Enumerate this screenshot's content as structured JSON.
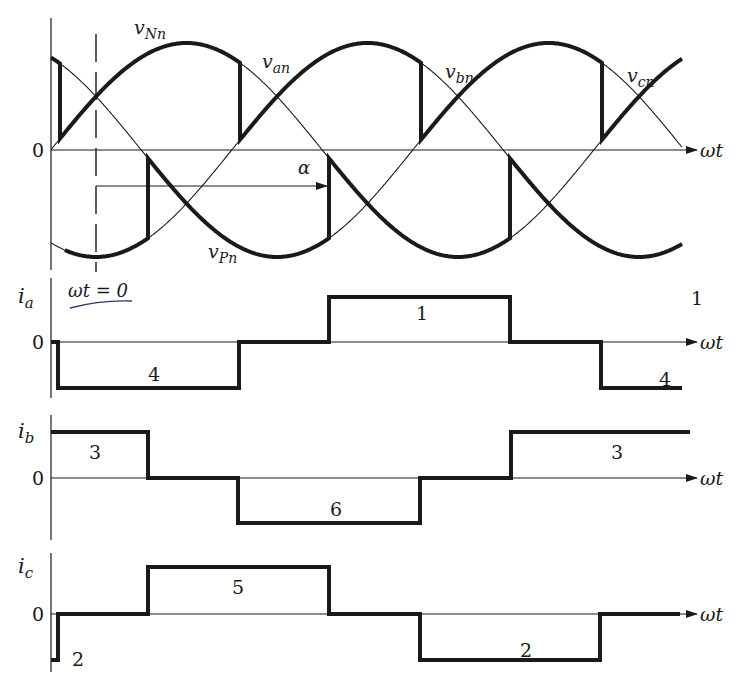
{
  "figure": {
    "width": 746,
    "height": 697,
    "colors": {
      "ink": "#1a1a1a",
      "background": "#ffffff",
      "annotation": "#2a3a6a"
    }
  },
  "geometry": {
    "axis_x": 51,
    "zero_x": 96,
    "px_per_60deg": 90.5,
    "axis_end_x": 697,
    "curve_end_x": 682
  },
  "voltage_plot": {
    "zero_y": 150,
    "amplitude_px": 107,
    "zero_label": "0",
    "axis_label": "ωt",
    "alpha_label": "α",
    "alpha_arrow": {
      "x1": 96,
      "x2": 329,
      "y": 186
    },
    "phases": [
      {
        "name": "van",
        "label_main": "v",
        "label_sub": "an",
        "phase_deg": 150,
        "label_x": 262,
        "label_y": 68
      },
      {
        "name": "vbn",
        "label_main": "v",
        "label_sub": "bn",
        "phase_deg": 30,
        "label_x": 445,
        "label_y": 78
      },
      {
        "name": "vcn",
        "label_main": "v",
        "label_sub": "cn",
        "phase_deg": -90,
        "label_x": 627,
        "label_y": 82
      }
    ],
    "envelope_labels": [
      {
        "name": "vNn",
        "main": "v",
        "sub": "Nn",
        "x": 134,
        "y": 34
      },
      {
        "name": "vPn",
        "main": "v",
        "sub": "Pn",
        "x": 208,
        "y": 258
      }
    ],
    "top_envelope": [
      {
        "phase": "van",
        "x1": 51,
        "x2": 60
      },
      {
        "phase": "vbn",
        "x1": 60,
        "x2": 240
      },
      {
        "phase": "vcn",
        "x1": 240,
        "x2": 421
      },
      {
        "phase": "van",
        "x1": 421,
        "x2": 602
      },
      {
        "phase": "vbn",
        "x1": 602,
        "x2": 682
      }
    ],
    "bottom_envelope": [
      {
        "phase": "vcn",
        "x1": 65,
        "x2": 148
      },
      {
        "phase": "van",
        "x1": 148,
        "x2": 329
      },
      {
        "phase": "vbn",
        "x1": 329,
        "x2": 510
      },
      {
        "phase": "vcn",
        "x1": 510,
        "x2": 682
      }
    ]
  },
  "current_plots": [
    {
      "name": "ia",
      "label_main": "i",
      "label_sub": "a",
      "zero_label": "0",
      "axis_label": "ωt",
      "zero_y": 342,
      "high_y": 297,
      "low_y": 388,
      "axis_top": 278,
      "axis_bottom": 398,
      "segments": [
        {
          "x1": 51,
          "x2": 58,
          "level": 0
        },
        {
          "x1": 58,
          "x2": 239,
          "level": -1
        },
        {
          "x1": 239,
          "x2": 329,
          "level": 0
        },
        {
          "x1": 329,
          "x2": 510,
          "level": 1
        },
        {
          "x1": 510,
          "x2": 601,
          "level": 0
        },
        {
          "x1": 601,
          "x2": 682,
          "level": -1
        }
      ],
      "annotations": [
        {
          "text": "4",
          "x": 148,
          "y": 381
        },
        {
          "text": "1",
          "x": 416,
          "y": 320
        },
        {
          "text": "1",
          "x": 691,
          "y": 305
        },
        {
          "text": "4",
          "x": 659,
          "y": 386
        }
      ],
      "note": {
        "text": "ωt = 0",
        "x": 68,
        "y": 297
      }
    },
    {
      "name": "ib",
      "label_main": "i",
      "label_sub": "b",
      "zero_label": "0",
      "axis_label": "ωt",
      "zero_y": 478,
      "high_y": 432,
      "low_y": 523,
      "axis_top": 415,
      "axis_bottom": 540,
      "segments": [
        {
          "x1": 51,
          "x2": 148,
          "level": 1
        },
        {
          "x1": 148,
          "x2": 238,
          "level": 0
        },
        {
          "x1": 238,
          "x2": 420,
          "level": -1
        },
        {
          "x1": 420,
          "x2": 511,
          "level": 0
        },
        {
          "x1": 511,
          "x2": 690,
          "level": 1
        }
      ],
      "annotations": [
        {
          "text": "3",
          "x": 89,
          "y": 459
        },
        {
          "text": "6",
          "x": 330,
          "y": 516
        },
        {
          "text": "3",
          "x": 611,
          "y": 459
        }
      ]
    },
    {
      "name": "ic",
      "label_main": "i",
      "label_sub": "c",
      "zero_label": "0",
      "axis_label": "ωt",
      "zero_y": 614,
      "high_y": 567,
      "low_y": 660,
      "axis_top": 553,
      "axis_bottom": 672,
      "segments": [
        {
          "x1": 51,
          "x2": 58,
          "level": -1
        },
        {
          "x1": 58,
          "x2": 148,
          "level": 0
        },
        {
          "x1": 148,
          "x2": 329,
          "level": 1
        },
        {
          "x1": 329,
          "x2": 420,
          "level": 0
        },
        {
          "x1": 420,
          "x2": 600,
          "level": -1
        },
        {
          "x1": 600,
          "x2": 680,
          "level": 0
        }
      ],
      "annotations": [
        {
          "text": "2",
          "x": 72,
          "y": 666
        },
        {
          "text": "5",
          "x": 232,
          "y": 594
        },
        {
          "text": "2",
          "x": 520,
          "y": 657
        }
      ]
    }
  ]
}
